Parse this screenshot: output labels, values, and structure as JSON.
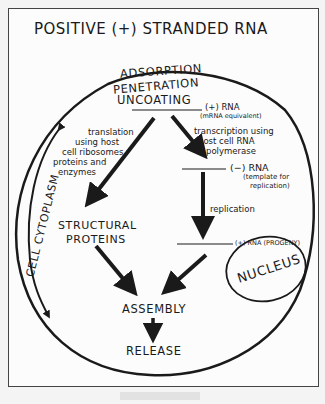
{
  "title": "POSITIVE (+) STRANDED RNA",
  "stages": {
    "adsorption": "ADSORPTION",
    "penetration": "PENETRATION",
    "uncoating": "UNCOATING",
    "structural_proteins_1": "STRUCTURAL",
    "structural_proteins_2": "PROTEINS",
    "assembly": "ASSEMBLY",
    "release": "RELEASE"
  },
  "rna": {
    "plus_rna": "(+) RNA",
    "plus_rna_note": "(mRNA equivalent)",
    "minus_rna": "(−) RNA",
    "minus_rna_note_1": "(template for",
    "minus_rna_note_2": "replication)",
    "progeny": "(+) RNA (PROGENY)"
  },
  "processes": {
    "translation_1": "translation",
    "translation_2": "using host",
    "translation_3": "cell ribosomes",
    "translation_4": "proteins and",
    "translation_5": "enzymes",
    "transcription_1": "transcription using",
    "transcription_2": "host cell RNA",
    "transcription_3": "polymerase",
    "replication": "replication"
  },
  "compartments": {
    "cytoplasm": "CELL CYTOPLASM",
    "nucleus": "NUCLEUS"
  },
  "colors": {
    "ink": "#1a1a1a",
    "paper": "#fcfcfc",
    "frame": "#444444"
  }
}
